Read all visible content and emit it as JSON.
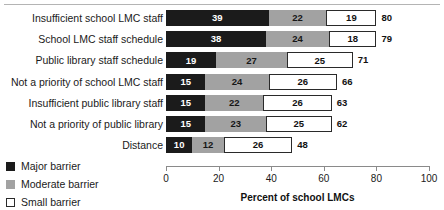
{
  "chart_data": {
    "type": "bar",
    "orientation": "horizontal",
    "stacked": true,
    "title": "",
    "xlabel": "Percent of school LMCs",
    "ylabel": "",
    "xlim": [
      0,
      100
    ],
    "xticks": [
      0,
      20,
      40,
      60,
      80,
      100
    ],
    "grid": false,
    "legend_position": "bottom-left",
    "categories": [
      "Insufficient school LMC staff",
      "School LMC staff schedule",
      "Public library staff schedule",
      "Not a priority of school LMC staff",
      "Insufficient public library staff",
      "Not a priority of public library",
      "Distance"
    ],
    "series": [
      {
        "name": "Major barrier",
        "color": "#1b1b1b",
        "values": [
          39,
          38,
          19,
          15,
          15,
          15,
          10
        ]
      },
      {
        "name": "Moderate barrier",
        "color": "#a2a2a2",
        "values": [
          22,
          24,
          27,
          24,
          22,
          23,
          12
        ]
      },
      {
        "name": "Small barrier",
        "color": "#ffffff",
        "values": [
          19,
          18,
          25,
          26,
          26,
          25,
          26
        ]
      }
    ],
    "totals": [
      80,
      79,
      71,
      66,
      63,
      62,
      48
    ]
  },
  "legend": {
    "items": [
      {
        "label": "Major barrier",
        "swatch": "swatch-major"
      },
      {
        "label": "Moderate barrier",
        "swatch": "swatch-moderate"
      },
      {
        "label": "Small barrier",
        "swatch": "swatch-small"
      }
    ]
  }
}
